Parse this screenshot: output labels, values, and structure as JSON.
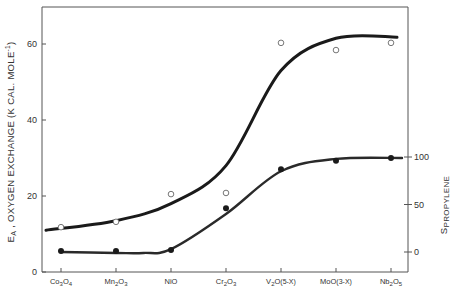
{
  "chart_data": {
    "type": "line",
    "title": "",
    "xlabel": "",
    "ylabel": "EA , OXYGEN EXCHANGE (K CAL. MOLE-1)",
    "y2label": "SPROPYLENE",
    "categories": [
      "Co3O4",
      "Mn2O3",
      "NiO",
      "Cr2O3",
      "V2O(5-X)",
      "MoO(3-X)",
      "Nb2O5"
    ],
    "ylim": [
      0,
      70
    ],
    "yticks": [
      0,
      20,
      40,
      60
    ],
    "y2lim": [
      -20,
      100
    ],
    "y2ticks": [
      0,
      50,
      100
    ],
    "grid": false,
    "legend": "none",
    "series": [
      {
        "name": "E_A oxygen exchange (open circles)",
        "axis": "left",
        "marker": "open-circle",
        "values": [
          11.8,
          13.2,
          20.5,
          20.8,
          60.3,
          58.4,
          60.3
        ],
        "fit_curve": [
          [
            0,
            11
          ],
          [
            1,
            13.5
          ],
          [
            2,
            18
          ],
          [
            3,
            28
          ],
          [
            4,
            53
          ],
          [
            5,
            61.5
          ],
          [
            6,
            61.8
          ]
        ]
      },
      {
        "name": "S propylene (filled circles)",
        "axis": "right",
        "marker": "filled-circle",
        "values": [
          1,
          1,
          2,
          46,
          87,
          96,
          99
        ],
        "fit_curve": [
          [
            0,
            0
          ],
          [
            1,
            -1
          ],
          [
            1.5,
            -1
          ],
          [
            2,
            3
          ],
          [
            3,
            40
          ],
          [
            4,
            85
          ],
          [
            5,
            98
          ],
          [
            6,
            99
          ]
        ]
      }
    ]
  },
  "axis": {
    "left_title_main": "E",
    "left_title_sub": "A",
    "left_title_rest": " , OXYGEN  EXCHANGE  (K CAL. MOLE",
    "left_title_sup": "-1",
    "left_title_end": ")",
    "right_title_main": "S",
    "right_title_sub": "PROPYLENE",
    "left_ticks": [
      "0",
      "20",
      "40",
      "60"
    ],
    "right_ticks": [
      "0",
      "50",
      "100"
    ]
  },
  "categories": [
    {
      "main": "Co",
      "sub1": "3",
      "mid": "O",
      "sub2": "4"
    },
    {
      "main": "Mn",
      "sub1": "2",
      "mid": "O",
      "sub2": "3"
    },
    {
      "main": "NiO",
      "sub1": "",
      "mid": "",
      "sub2": ""
    },
    {
      "main": "Cr",
      "sub1": "2",
      "mid": "O",
      "sub2": "3"
    },
    {
      "main": "V",
      "sub1": "2",
      "mid": "O",
      "sub2": "(5-X)"
    },
    {
      "main": "MoO",
      "sub1": "",
      "mid": "",
      "sub2": "(3-X)"
    },
    {
      "main": "Nb",
      "sub1": "2",
      "mid": "O",
      "sub2": "5"
    }
  ]
}
